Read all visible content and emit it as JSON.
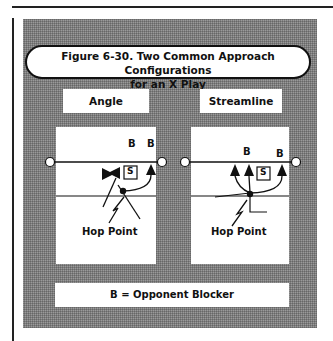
{
  "figure": {
    "title_line1": "Figure 6-30. Two Common Approach Configurations",
    "title_line2": "for an X Play",
    "legend": "B = Opponent Blocker"
  },
  "panels": [
    {
      "label": "Angle",
      "blocker_labels": [
        "B",
        "B"
      ],
      "setter_label": "S",
      "hop_point_label": "Hop Point"
    },
    {
      "label": "Streamline",
      "blocker_labels": [
        "B",
        "B"
      ],
      "setter_label": "S",
      "hop_point_label": "Hop Point"
    }
  ],
  "colors": {
    "panel_gray": "#7d7d7d",
    "ink": "#111111",
    "paper": "#ffffff"
  }
}
